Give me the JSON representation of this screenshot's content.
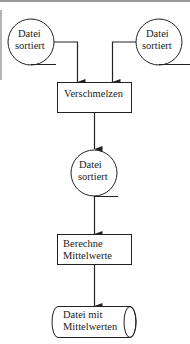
{
  "diagram": {
    "type": "flowchart",
    "colors": {
      "stroke": "#222222",
      "background": "#ffffff"
    },
    "nodes": [
      {
        "id": "file1",
        "shape": "circle-file",
        "label_line1": "Datei",
        "label_line2": "sortiert"
      },
      {
        "id": "file2",
        "shape": "circle-file",
        "label_line1": "Datei",
        "label_line2": "sortiert"
      },
      {
        "id": "merge",
        "shape": "rectangle",
        "label": "Verschmelzen"
      },
      {
        "id": "file3",
        "shape": "circle-file",
        "label_line1": "Datei",
        "label_line2": "sortiert"
      },
      {
        "id": "compute",
        "shape": "rectangle",
        "label_line1": "Berechne",
        "label_line2": "Mittelwerte"
      },
      {
        "id": "output",
        "shape": "cylinder",
        "label_line1": "Datei mit",
        "label_line2": "Mittelwerten"
      }
    ],
    "edges": [
      {
        "from": "file1",
        "to": "merge"
      },
      {
        "from": "file2",
        "to": "merge"
      },
      {
        "from": "merge",
        "to": "file3"
      },
      {
        "from": "file3",
        "to": "compute"
      },
      {
        "from": "compute",
        "to": "output"
      }
    ]
  }
}
